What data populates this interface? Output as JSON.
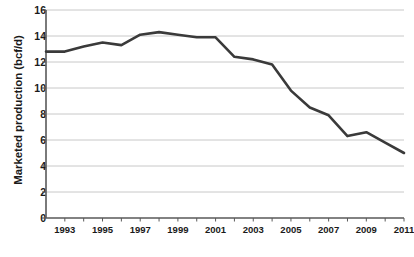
{
  "chart_data": {
    "type": "line",
    "title": "",
    "xlabel": "",
    "ylabel": "Marketed production (bcf/d)",
    "ylim": [
      0,
      16
    ],
    "xlim": [
      1992,
      2011
    ],
    "ytick_labels": [
      "0",
      "2",
      "4",
      "6",
      "8",
      "10",
      "12",
      "14",
      "16"
    ],
    "ytick_values": [
      0,
      2,
      4,
      6,
      8,
      10,
      12,
      14,
      16
    ],
    "xtick_labels": [
      "1993",
      "1995",
      "1997",
      "1999",
      "2001",
      "2003",
      "2005",
      "2007",
      "2009",
      "2011"
    ],
    "xtick_values": [
      1993,
      1995,
      1997,
      1999,
      2001,
      2003,
      2005,
      2007,
      2009,
      2011
    ],
    "grid": "horizontal",
    "legend": "none",
    "line_color": "#3a3a3a",
    "gridline_color": "#c8c8c8",
    "axis_color": "#595959",
    "x": [
      1992,
      1993,
      1994,
      1995,
      1996,
      1997,
      1998,
      1999,
      2000,
      2001,
      2002,
      2003,
      2004,
      2005,
      2006,
      2007,
      2008,
      2009,
      2010,
      2011
    ],
    "values": [
      12.8,
      12.8,
      13.2,
      13.5,
      13.3,
      14.1,
      14.3,
      14.1,
      13.9,
      13.9,
      12.4,
      12.2,
      11.8,
      9.8,
      8.5,
      7.9,
      6.3,
      6.6,
      5.8,
      5.0
    ],
    "series": [
      {
        "name": "Marketed production",
        "values": [
          12.8,
          12.8,
          13.2,
          13.5,
          13.3,
          14.1,
          14.3,
          14.1,
          13.9,
          13.9,
          12.4,
          12.2,
          11.8,
          9.8,
          8.5,
          7.9,
          6.3,
          6.6,
          5.8,
          5.0
        ]
      }
    ]
  }
}
